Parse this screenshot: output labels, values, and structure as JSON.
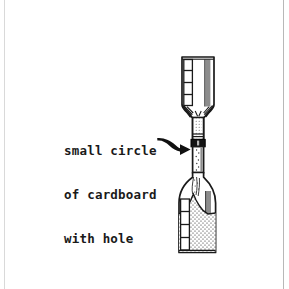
{
  "figure": {
    "background_color": "#ffffff",
    "border_color": "#d9d9d9",
    "ink_color": "#1a1a1a"
  },
  "caption": {
    "line1": "small circle",
    "line2": "of cardboard",
    "line3": "with hole",
    "full_text": "small circle of cardboard with hole",
    "color": "#1a1a1a"
  },
  "pointer": {
    "icon": "curved-arrow-icon",
    "direction": "right",
    "target": "cardboard-disc"
  },
  "diagram": {
    "top_bottle": {
      "name": "upper-bottle",
      "orientation": "inverted",
      "label_strip_ticks": 3,
      "contents": "empty",
      "highlight_color": "#8c8c8c"
    },
    "neck": {
      "name": "bottle-neck-joint",
      "description": "narrow necks joined",
      "disc_color": "#141414"
    },
    "cardboard_disc": {
      "name": "cardboard-disc",
      "description": "small circle of cardboard with hole",
      "color": "#141414"
    },
    "bottom_bottle": {
      "name": "lower-bottle",
      "orientation": "upright",
      "label_strip_ticks": 3,
      "contents": "sand",
      "fill_pattern": "stipple",
      "highlight_color": "#8c8c8c"
    },
    "sand_stream": {
      "name": "sand-stream",
      "description": "sand falling through neck"
    }
  }
}
